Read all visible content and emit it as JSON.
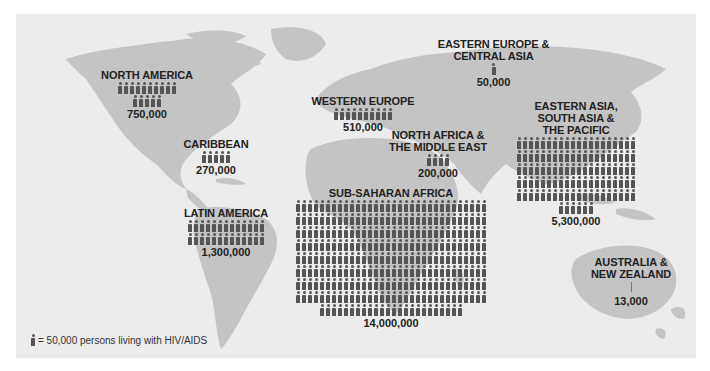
{
  "legend": {
    "text": "= 50,000 persons living with HIV/AIDS",
    "icon": "person-icon",
    "unit": 50000
  },
  "colors": {
    "ocean": "#ececec",
    "land": "#c4c4c4",
    "icon": "#555555",
    "text": "#222222"
  },
  "regions": [
    {
      "id": "north-america",
      "name": "NORTH AMERICA",
      "value": "750,000",
      "icons": 15,
      "rows": [
        10,
        5
      ]
    },
    {
      "id": "caribbean",
      "name": "CARIBBEAN",
      "value": "270,000",
      "icons": 5,
      "rows": [
        5
      ]
    },
    {
      "id": "latin-america",
      "name": "LATIN AMERICA",
      "value": "1,300,000",
      "icons": 26,
      "rows": [
        13,
        13
      ]
    },
    {
      "id": "western-europe",
      "name": "WESTERN EUROPE",
      "value": "510,000",
      "icons": 10,
      "rows": [
        10
      ]
    },
    {
      "id": "eastern-europe-central-asia",
      "name": "EASTERN EUROPE & CENTRAL ASIA",
      "value": "50,000",
      "icons": 1,
      "rows": [
        1
      ]
    },
    {
      "id": "north-africa-middle-east",
      "name": "NORTH AFRICA & THE MIDDLE EAST",
      "value": "200,000",
      "icons": 4,
      "rows": [
        4
      ]
    },
    {
      "id": "east-south-asia-pacific",
      "name": "EASTERN ASIA, SOUTH ASIA & THE PACIFIC",
      "value": "5,300,000",
      "icons": 106,
      "rows": [
        20,
        20,
        20,
        20,
        20,
        6
      ]
    },
    {
      "id": "sub-saharan-africa",
      "name": "SUB-SAHARAN AFRICA",
      "value": "14,000,000",
      "icons": 280,
      "rows": [
        32,
        32,
        32,
        32,
        32,
        32,
        32,
        32,
        24
      ]
    },
    {
      "id": "australia-new-zealand",
      "name": "AUSTRALIA & NEW ZEALAND",
      "value": "13,000",
      "icons": 0,
      "rows": []
    }
  ],
  "chart_data": {
    "type": "bar",
    "categories": [
      "North America",
      "Caribbean",
      "Latin America",
      "Western Europe",
      "Eastern Europe & Central Asia",
      "North Africa & the Middle East",
      "Eastern Asia, South Asia & the Pacific",
      "Sub-Saharan Africa",
      "Australia & New Zealand"
    ],
    "values": [
      750000,
      270000,
      1300000,
      510000,
      50000,
      200000,
      5300000,
      14000000,
      13000
    ],
    "xlabel": "",
    "ylabel": "Persons living with HIV/AIDS",
    "legend": [
      "1 icon = 50,000 persons living with HIV/AIDS"
    ],
    "grid": false
  }
}
